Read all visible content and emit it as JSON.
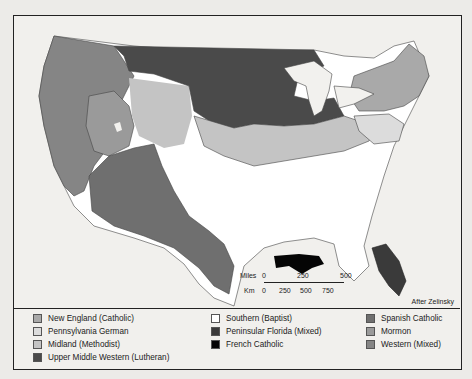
{
  "map": {
    "credit": "After Zelinsky",
    "scale": {
      "miles_label": "Miles",
      "miles_ticks": [
        "0",
        "250",
        "500"
      ],
      "km_label": "Km",
      "km_ticks": [
        "0",
        "250",
        "500",
        "750"
      ]
    }
  },
  "legend": {
    "columns": [
      [
        {
          "label": "New England (Catholic)",
          "color": "#a9a9a9"
        },
        {
          "label": "Pennsylvania German",
          "color": "#dcdcdc"
        },
        {
          "label": "Midland (Methodist)",
          "color": "#c4c4c4"
        },
        {
          "label": "Upper Middle Western (Lutheran)",
          "color": "#4a4a4a"
        }
      ],
      [
        {
          "label": "Southern (Baptist)",
          "color": "#ffffff"
        },
        {
          "label": "Peninsular Florida (Mixed)",
          "color": "#3a3a3a"
        },
        {
          "label": "French Catholic",
          "color": "#050505"
        }
      ],
      [
        {
          "label": "Spanish Catholic",
          "color": "#6f6f6f"
        },
        {
          "label": "Mormon",
          "color": "#9a9a9a"
        },
        {
          "label": "Western (Mixed)",
          "color": "#858585"
        }
      ]
    ]
  },
  "colors": {
    "upper_midwest": "#4a4a4a",
    "western": "#858585",
    "mormon": "#9a9a9a",
    "spanish": "#6f6f6f",
    "midland": "#c4c4c4",
    "penn_german": "#dcdcdc",
    "new_england": "#a9a9a9",
    "southern": "#ffffff",
    "florida": "#3a3a3a",
    "french": "#050505",
    "water": "#f2f1ee"
  }
}
